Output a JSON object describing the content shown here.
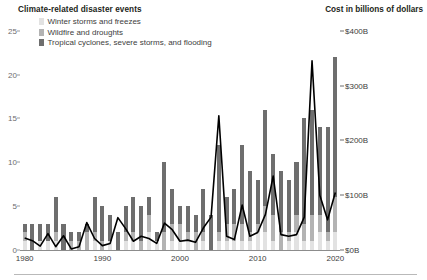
{
  "header": {
    "left_title": "Climate-related disaster events",
    "right_title": "Cost in billions of dollars"
  },
  "legend": {
    "items": [
      {
        "label": "Winter storms and freezes",
        "color": "#e2e2e2",
        "key": "winter"
      },
      {
        "label": "Wildfire and droughts",
        "color": "#b3b3b3",
        "key": "wildfire"
      },
      {
        "label": "Tropical cyclones, severe storms, and flooding",
        "color": "#6e6e6e",
        "key": "tropical"
      }
    ]
  },
  "chart_data": {
    "type": "bar",
    "title": "Climate-related disaster events",
    "xlabel": "",
    "ylabel": "Number of events",
    "y2label": "Cost in billions of dollars",
    "grid": false,
    "legend_position": "top-left",
    "x": [
      1980,
      1981,
      1982,
      1983,
      1984,
      1985,
      1986,
      1987,
      1988,
      1989,
      1990,
      1991,
      1992,
      1993,
      1994,
      1995,
      1996,
      1997,
      1998,
      1999,
      2000,
      2001,
      2002,
      2003,
      2004,
      2005,
      2006,
      2007,
      2008,
      2009,
      2010,
      2011,
      2012,
      2013,
      2014,
      2015,
      2016,
      2017,
      2018,
      2019,
      2020
    ],
    "xlim": [
      1979.4,
      2020.6
    ],
    "ylim": [
      0,
      26
    ],
    "y2lim": [
      0,
      416
    ],
    "yticks": [
      0,
      5,
      10,
      15,
      20,
      25
    ],
    "ytick_labels": [
      "0",
      "5",
      "10",
      "15",
      "20",
      "25"
    ],
    "y2ticks": [
      0,
      100,
      200,
      300,
      400
    ],
    "y2tick_labels": [
      "$0B",
      "$100B",
      "$200B",
      "$300B",
      "$400B"
    ],
    "xticks": [
      1980,
      1990,
      2000,
      2010,
      2020
    ],
    "xtick_labels": [
      "1980",
      "1990",
      "2000",
      "2010",
      "2020"
    ],
    "series": [
      {
        "name": "Winter storms and freezes",
        "key": "winter",
        "color": "#e2e2e2",
        "values": [
          1,
          0,
          1,
          1,
          1,
          0,
          0,
          0,
          0,
          1,
          0,
          1,
          0,
          1,
          1,
          0,
          2,
          1,
          0,
          1,
          1,
          1,
          0,
          1,
          0,
          1,
          1,
          1,
          1,
          1,
          2,
          2,
          1,
          0,
          1,
          2,
          1,
          1,
          2,
          1,
          2
        ]
      },
      {
        "name": "Wildfire and droughts",
        "key": "wildfire",
        "color": "#b3b3b3",
        "values": [
          1,
          0,
          0,
          0,
          1,
          0,
          1,
          1,
          2,
          1,
          1,
          0,
          0,
          1,
          1,
          1,
          2,
          0,
          2,
          2,
          2,
          1,
          2,
          1,
          0,
          1,
          2,
          2,
          2,
          1,
          1,
          3,
          3,
          2,
          1,
          2,
          2,
          3,
          2,
          1,
          4
        ]
      },
      {
        "name": "Tropical cyclones, severe storms, and flooding",
        "key": "tropical",
        "color": "#6e6e6e",
        "values": [
          1,
          3,
          2,
          2,
          4,
          3,
          1,
          1,
          1,
          4,
          4,
          3,
          2,
          3,
          4,
          4,
          2,
          1,
          8,
          4,
          2,
          3,
          2,
          5,
          4,
          10,
          3,
          4,
          9,
          7,
          5,
          11,
          7,
          7,
          6,
          6,
          12,
          12,
          10,
          12,
          16
        ]
      }
    ],
    "line": {
      "name": "Cost in billions of dollars",
      "color": "#000000",
      "values": [
        22,
        17,
        7,
        30,
        6,
        26,
        2,
        6,
        50,
        21,
        8,
        12,
        59,
        39,
        16,
        25,
        21,
        12,
        49,
        37,
        16,
        18,
        14,
        40,
        60,
        245,
        25,
        19,
        82,
        25,
        32,
        65,
        135,
        28,
        25,
        28,
        60,
        345,
        100,
        55,
        105
      ]
    }
  },
  "footer": {
    "rule": ""
  }
}
